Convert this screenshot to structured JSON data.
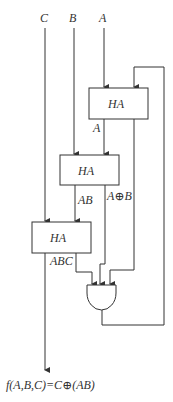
{
  "inputs": {
    "c": "C",
    "b": "B",
    "a": "A"
  },
  "blocks": {
    "ha_top": "HA",
    "ha_mid": "HA",
    "ha_bottom": "HA"
  },
  "signals": {
    "a_carry": "A",
    "ab": "AB",
    "a_xor_b": "A⊕B",
    "abc": "ABC"
  },
  "gate": {
    "type": "AND"
  },
  "output": {
    "label": "f(A,B,C)=C⊕(AB)"
  },
  "colors": {
    "line": "#333333",
    "background": "#ffffff"
  }
}
